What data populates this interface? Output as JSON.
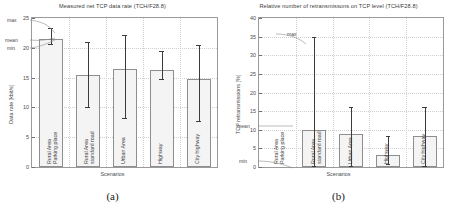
{
  "figure": {
    "panels": [
      {
        "id": "a",
        "subcaption": "(a)",
        "annotations": [
          {
            "name": "max-annotation",
            "text": "max"
          },
          {
            "name": "mean-annotation",
            "text": "mean"
          },
          {
            "name": "min-annotation",
            "text": "min"
          }
        ],
        "chart_data": {
          "type": "bar",
          "title": "Measured net TCP data rate (TCH/F28.8)",
          "xlabel": "Scenarios",
          "ylabel": "Data rate [kbit/s]",
          "ylim": [
            0,
            25
          ],
          "yticks": [
            0,
            5,
            10,
            15,
            20,
            25
          ],
          "grid": true,
          "legend": "none",
          "categories": [
            "Rural Area\nParking place",
            "Rural Area\nstandard road",
            "Urban Area",
            "Highway",
            "City highway"
          ],
          "category_lines": [
            [
              "Rural Area",
              "Parking place"
            ],
            [
              "Rural Area",
              "standard road"
            ],
            [
              "Urban Area"
            ],
            [
              "Highway"
            ],
            [
              "City highway"
            ]
          ],
          "series": [
            {
              "name": "mean",
              "values": [
                21.4,
                15.4,
                16.5,
                16.2,
                14.8
              ]
            },
            {
              "name": "min",
              "values": [
                20.6,
                10.0,
                8.2,
                14.7,
                7.8
              ]
            },
            {
              "name": "max",
              "values": [
                23.3,
                21.0,
                22.2,
                19.5,
                20.5
              ]
            }
          ]
        }
      },
      {
        "id": "b",
        "subcaption": "(b)",
        "annotations": [
          {
            "name": "max-annotation",
            "text": "max"
          },
          {
            "name": "mean-annotation",
            "text": "mean"
          },
          {
            "name": "min-annotation",
            "text": "min"
          }
        ],
        "chart_data": {
          "type": "bar",
          "title": "Relative number of retransmissons on TCP level (TCH/F28.8)",
          "xlabel": "Scenarios",
          "ylabel": "TCP retransmissions [%]",
          "ylim": [
            0,
            40
          ],
          "yticks": [
            0,
            5,
            10,
            15,
            20,
            25,
            30,
            35,
            40
          ],
          "grid": true,
          "legend": "none",
          "categories": [
            "Rural Area\nParking place",
            "Rural Area\nstandard road",
            "Urban Area",
            "Highway",
            "City highway"
          ],
          "category_lines": [
            [
              "Rural Area",
              "Parking place"
            ],
            [
              "Rural Area",
              "standard road"
            ],
            [
              "Urban Area"
            ],
            [
              "Highway"
            ],
            [
              "City highway"
            ]
          ],
          "series": [
            {
              "name": "mean",
              "values": [
                0,
                10.0,
                8.8,
                3.3,
                8.4
              ]
            },
            {
              "name": "min",
              "values": [
                0,
                0.4,
                0.3,
                0.9,
                0.2
              ]
            },
            {
              "name": "max",
              "values": [
                0,
                35.0,
                16.0,
                8.2,
                16.2
              ]
            }
          ]
        }
      }
    ]
  }
}
